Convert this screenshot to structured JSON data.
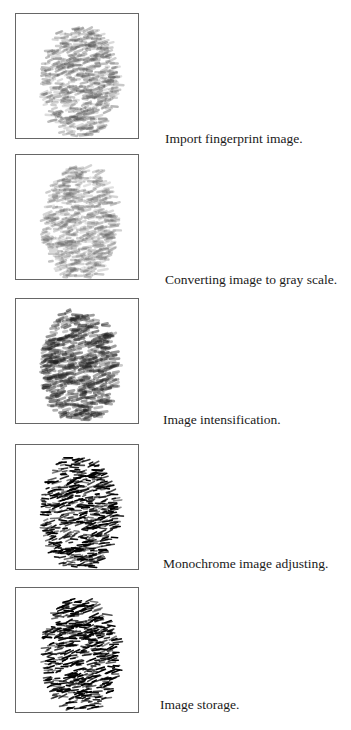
{
  "steps": [
    {
      "caption": "Import fingerprint image.",
      "style": "soft",
      "top": 13,
      "capLeft": 165,
      "capTop": 118
    },
    {
      "caption": "Converting image to gray scale.",
      "style": "gray",
      "top": 154,
      "capLeft": 165,
      "capTop": 118
    },
    {
      "caption": "Image intensification.",
      "style": "dark",
      "top": 298,
      "capLeft": 163,
      "capTop": 114
    },
    {
      "caption": "Monochrome image adjusting.",
      "style": "mono",
      "top": 444,
      "capLeft": 163,
      "capTop": 112
    },
    {
      "caption": "Image storage.",
      "style": "mono",
      "top": 587,
      "capLeft": 160,
      "capTop": 110
    }
  ]
}
